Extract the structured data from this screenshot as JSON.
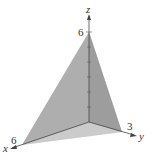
{
  "diagram": {
    "type": "3d-tetrahedron",
    "axes": {
      "x": {
        "label": "x",
        "intercept_label": "6"
      },
      "y": {
        "label": "y",
        "intercept_label": "3"
      },
      "z": {
        "label": "z",
        "intercept_label": "6"
      }
    },
    "vertices": {
      "origin": [
        0,
        0,
        0
      ],
      "x_intercept": [
        6,
        0,
        0
      ],
      "y_intercept": [
        0,
        3,
        0
      ],
      "z_intercept": [
        0,
        0,
        6
      ]
    },
    "colors": {
      "front_face": "#a8a8a8",
      "right_face": "#8e8e8e",
      "bottom_face": "#d4d4d4",
      "axis": "#444444"
    }
  }
}
